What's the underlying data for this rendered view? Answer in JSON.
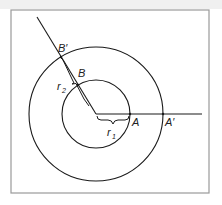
{
  "diagram": {
    "type": "concentric-circles-angle",
    "colors": {
      "stroke": "#1a1a1a",
      "frame": "#9a9a9a",
      "top_strip": "#f0f0f0"
    },
    "labels": {
      "B_prime": "B′",
      "B": "B",
      "A": "A",
      "A_prime": "A′",
      "r1": "r",
      "r1_sub": "1",
      "r2": "r",
      "r2_sub": "2"
    },
    "geometry": {
      "center": [
        96,
        114
      ],
      "inner_radius": 34,
      "outer_radius": 67,
      "ray_horizontal_end": [
        202,
        114
      ],
      "ray_diagonal_end": [
        37,
        17
      ]
    }
  }
}
